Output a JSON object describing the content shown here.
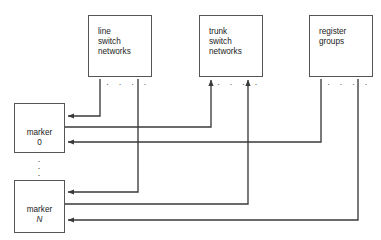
{
  "diagram": {
    "line_color": "#3a3a3a",
    "box_border_color": "#555555",
    "background": "#ffffff",
    "nodes": [
      {
        "id": "line-switch-networks",
        "label": "line\nswitch\nnetworks",
        "x": 88,
        "y": 15,
        "w": 64,
        "h": 62
      },
      {
        "id": "trunk-switch-networks",
        "label": "trunk\nswitch\nnetworks",
        "x": 199,
        "y": 15,
        "w": 64,
        "h": 62
      },
      {
        "id": "register-groups",
        "label": "register\ngroups",
        "x": 309,
        "y": 15,
        "w": 64,
        "h": 62
      }
    ],
    "markers": [
      {
        "id": "marker-0",
        "name": "marker",
        "index": "0",
        "italic": false,
        "x": 14,
        "y": 103,
        "w": 51,
        "h": 50
      },
      {
        "id": "marker-n",
        "name": "marker",
        "index": "N",
        "italic": true,
        "x": 14,
        "y": 180,
        "w": 51,
        "h": 53
      }
    ],
    "ellipses": [
      {
        "id": "line-switch-ellipsis",
        "text": "· · · ·",
        "x": 106,
        "y": 80
      },
      {
        "id": "trunk-switch-ellipsis",
        "text": "· · · ·",
        "x": 217,
        "y": 80
      },
      {
        "id": "register-groups-ellipsis",
        "text": "· · · ·",
        "x": 327,
        "y": 80
      },
      {
        "id": "marker-vertical-ellipsis",
        "text": "·\n·\n·",
        "x": 35,
        "y": 158
      }
    ],
    "connections": [
      {
        "id": "line-switch-to-marker-0",
        "from": "line-switch-networks",
        "to": "marker-0",
        "direction": "down-left"
      },
      {
        "id": "marker-0-to-trunk-switch",
        "from": "marker-0",
        "to": "trunk-switch-networks",
        "direction": "right-up"
      },
      {
        "id": "register-groups-to-marker-0",
        "from": "register-groups",
        "to": "marker-0",
        "direction": "down-left"
      },
      {
        "id": "line-switch-to-marker-n",
        "from": "line-switch-networks",
        "to": "marker-n",
        "direction": "down-left"
      },
      {
        "id": "marker-n-to-trunk-switch",
        "from": "marker-n",
        "to": "trunk-switch-networks",
        "direction": "right-up"
      },
      {
        "id": "register-groups-to-marker-n",
        "from": "register-groups",
        "to": "marker-n",
        "direction": "down-left"
      }
    ]
  }
}
